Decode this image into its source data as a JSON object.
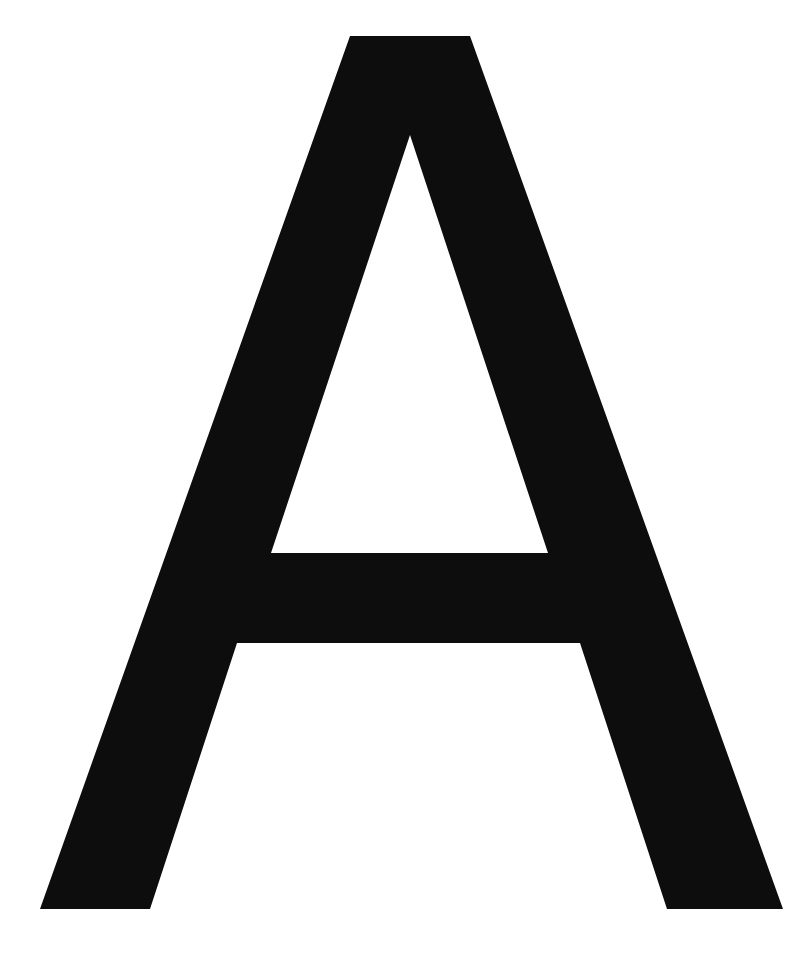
{
  "glyph": {
    "character": "A",
    "fill_color": "#0d0d0d",
    "background_color": "#ffffff",
    "outer_path": "M350,36 L470,36 L783,909 L667,909 L580,643 L237,643 L150,909 L40,909 Z",
    "counter_path": "M410,135 L548,553 L271,553 Z"
  }
}
